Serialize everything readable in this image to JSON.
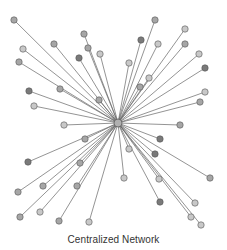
{
  "diagram": {
    "title": "Centralized Network",
    "type": "star-network",
    "colors": {
      "edge": "#666666",
      "node_stroke": "#555555",
      "light": "#c8c8c8",
      "mid": "#a6a6a6",
      "dark": "#7a7a7a",
      "hub": "#b0b0b0"
    },
    "hub": {
      "x": 118,
      "y": 123,
      "r": 4
    },
    "nodes": [
      {
        "x": 14,
        "y": 20,
        "shade": "mid"
      },
      {
        "x": 54,
        "y": 44,
        "shade": "mid"
      },
      {
        "x": 23,
        "y": 49,
        "shade": "light"
      },
      {
        "x": 84,
        "y": 34,
        "shade": "mid"
      },
      {
        "x": 88,
        "y": 48,
        "shade": "mid"
      },
      {
        "x": 79,
        "y": 58,
        "shade": "dark"
      },
      {
        "x": 100,
        "y": 54,
        "shade": "light"
      },
      {
        "x": 19,
        "y": 62,
        "shade": "mid"
      },
      {
        "x": 60,
        "y": 89,
        "shade": "mid"
      },
      {
        "x": 29,
        "y": 91,
        "shade": "dark"
      },
      {
        "x": 99,
        "y": 100,
        "shade": "mid"
      },
      {
        "x": 34,
        "y": 106,
        "shade": "light"
      },
      {
        "x": 155,
        "y": 20,
        "shade": "mid"
      },
      {
        "x": 141,
        "y": 40,
        "shade": "dark"
      },
      {
        "x": 158,
        "y": 44,
        "shade": "light"
      },
      {
        "x": 185,
        "y": 29,
        "shade": "light"
      },
      {
        "x": 185,
        "y": 44,
        "shade": "mid"
      },
      {
        "x": 129,
        "y": 63,
        "shade": "light"
      },
      {
        "x": 199,
        "y": 54,
        "shade": "light"
      },
      {
        "x": 205,
        "y": 68,
        "shade": "dark"
      },
      {
        "x": 149,
        "y": 78,
        "shade": "light"
      },
      {
        "x": 140,
        "y": 87,
        "shade": "mid"
      },
      {
        "x": 205,
        "y": 92,
        "shade": "light"
      },
      {
        "x": 200,
        "y": 102,
        "shade": "mid"
      },
      {
        "x": 64,
        "y": 125,
        "shade": "light"
      },
      {
        "x": 85,
        "y": 139,
        "shade": "mid"
      },
      {
        "x": 28,
        "y": 162,
        "shade": "dark"
      },
      {
        "x": 80,
        "y": 163,
        "shade": "mid"
      },
      {
        "x": 43,
        "y": 186,
        "shade": "mid"
      },
      {
        "x": 18,
        "y": 192,
        "shade": "mid"
      },
      {
        "x": 77,
        "y": 186,
        "shade": "mid"
      },
      {
        "x": 20,
        "y": 217,
        "shade": "mid"
      },
      {
        "x": 40,
        "y": 212,
        "shade": "light"
      },
      {
        "x": 59,
        "y": 221,
        "shade": "mid"
      },
      {
        "x": 89,
        "y": 222,
        "shade": "light"
      },
      {
        "x": 180,
        "y": 125,
        "shade": "mid"
      },
      {
        "x": 160,
        "y": 139,
        "shade": "dark"
      },
      {
        "x": 155,
        "y": 154,
        "shade": "dark"
      },
      {
        "x": 129,
        "y": 149,
        "shade": "light"
      },
      {
        "x": 210,
        "y": 178,
        "shade": "mid"
      },
      {
        "x": 124,
        "y": 178,
        "shade": "light"
      },
      {
        "x": 159,
        "y": 179,
        "shade": "light"
      },
      {
        "x": 160,
        "y": 202,
        "shade": "dark"
      },
      {
        "x": 195,
        "y": 203,
        "shade": "light"
      },
      {
        "x": 191,
        "y": 217,
        "shade": "light"
      },
      {
        "x": 201,
        "y": 225,
        "shade": "light"
      }
    ]
  }
}
